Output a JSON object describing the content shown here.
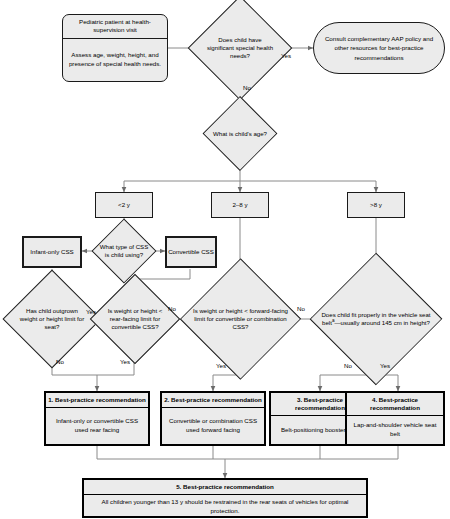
{
  "diagram": {
    "style": {
      "fill": "#ebebeb",
      "stroke": "#1a1a1a",
      "text": "#000000"
    }
  },
  "nodes": {
    "start": {
      "header": "Pediatric patient at health-supervision visit",
      "body": "Assess age, weight, height, and presence of special health needs."
    },
    "special_needs_q": "Does child have significant special health needs?",
    "aap_consult": "Consult complementary AAP policy and other resources for best-practice recommendations",
    "age_q": "What is child's age?",
    "age_under2": "<2 y",
    "age_2to8": "2–8 y",
    "age_over8": ">8 y",
    "css_type_q": "What type of CSS is child using?",
    "infant_only": "Infant-only CSS",
    "convertible": "Convertible CSS",
    "outgrown_q": "Has child outgrown weight or height limit for seat?",
    "rear_facing_q": "Is weight or height < rear-facing limit for convertible CSS?",
    "forward_facing_q": "Is weight or height < forward-facing limit for convertible or combination CSS?",
    "seatbelt_fit_q_pre": "Does child fit properly in the vehicle seat belt",
    "seatbelt_fit_q_sup": "a",
    "seatbelt_fit_q_post": "—usually around 145 cm in height?",
    "rec1": {
      "header": "1. Best-practice recommendation",
      "body": "Infant-only or convertible CSS used rear facing"
    },
    "rec2": {
      "header": "2. Best-practice recommendation",
      "body": "Convertible or combination CSS used forward facing"
    },
    "rec3": {
      "header": "3. Best-practice recommendation",
      "body": "Belt-positioning booster seat"
    },
    "rec4": {
      "header": "4. Best-practice recommendation",
      "body": "Lap-and-shoulder vehicle seat belt"
    },
    "rec5": {
      "header": "5. Best-practice recommendation",
      "body": "All children younger than 13 y should be restrained in the rear seats of vehicles for optimal protection."
    }
  },
  "edge_labels": {
    "special_needs_yes": "Yes",
    "special_needs_no": "No",
    "outgrown_yes": "Yes",
    "outgrown_no": "No",
    "rear_facing_no": "No",
    "rear_facing_yes": "Yes",
    "forward_facing_yes": "Yes",
    "forward_facing_no": "No",
    "seatbelt_no": "No",
    "seatbelt_yes": "Yes"
  }
}
